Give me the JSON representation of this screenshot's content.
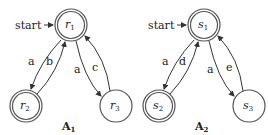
{
  "automata": [
    {
      "title": "A",
      "title_sub": "1",
      "start_label": "start",
      "states": [
        {
          "id": "r1",
          "name": "r",
          "sub": "1",
          "accepting": true,
          "initial": true
        },
        {
          "id": "r2",
          "name": "r",
          "sub": "2",
          "accepting": true,
          "initial": false
        },
        {
          "id": "r3",
          "name": "r",
          "sub": "3",
          "accepting": false,
          "initial": false
        }
      ],
      "transitions": [
        {
          "from": "r1",
          "to": "r2",
          "label": "a"
        },
        {
          "from": "r2",
          "to": "r1",
          "label": "b"
        },
        {
          "from": "r1",
          "to": "r3",
          "label": "a"
        },
        {
          "from": "r3",
          "to": "r1",
          "label": "c"
        }
      ]
    },
    {
      "title": "A",
      "title_sub": "2",
      "start_label": "start",
      "states": [
        {
          "id": "s1",
          "name": "s",
          "sub": "1",
          "accepting": true,
          "initial": true
        },
        {
          "id": "s2",
          "name": "s",
          "sub": "2",
          "accepting": true,
          "initial": false
        },
        {
          "id": "s3",
          "name": "s",
          "sub": "3",
          "accepting": false,
          "initial": false
        }
      ],
      "transitions": [
        {
          "from": "s1",
          "to": "s2",
          "label": "a"
        },
        {
          "from": "s2",
          "to": "s1",
          "label": "d"
        },
        {
          "from": "s1",
          "to": "s3",
          "label": "a"
        },
        {
          "from": "s3",
          "to": "s1",
          "label": "e"
        }
      ]
    }
  ]
}
